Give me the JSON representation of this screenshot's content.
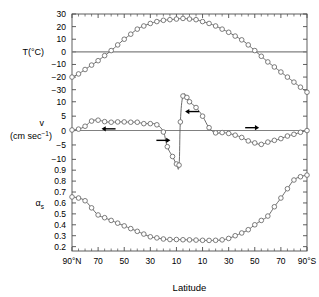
{
  "figure": {
    "background_color": "#ffffff",
    "frame_color": "#4d4d4d",
    "curve_color": "#5a5a5a",
    "marker_color": "#666666",
    "zero_line_color": "#808080",
    "arrow_color": "#000000"
  },
  "axes": {
    "x": {
      "title": "Latitude",
      "tick_labels": [
        "90°N",
        "70",
        "50",
        "30",
        "10",
        "10",
        "30",
        "50",
        "70",
        "90°S"
      ],
      "tick_values": [
        90,
        70,
        50,
        30,
        10,
        -10,
        -30,
        -50,
        -70,
        -90
      ],
      "range": [
        90,
        -90
      ],
      "minor_tick_step": 5
    },
    "temperature": {
      "label": "T(°C)",
      "unit": "°C",
      "tick_labels": [
        "30",
        "20",
        "10",
        "0",
        "−10",
        "−20",
        "−30"
      ],
      "tick_values": [
        30,
        20,
        10,
        0,
        -10,
        -20,
        -30
      ],
      "range": [
        -35,
        30
      ]
    },
    "velocity": {
      "label_line1": "v",
      "label_line2_prefix": "(cm sec",
      "label_line2_sup": "−1",
      "label_line2_suffix": ")",
      "tick_labels": [
        "10",
        "5",
        "0",
        "−5",
        "−10"
      ],
      "tick_values": [
        10,
        5,
        0,
        -5,
        -10
      ],
      "range": [
        -13,
        12
      ]
    },
    "albedo": {
      "label_base": "α",
      "label_sub": "s",
      "tick_labels": [
        "0.9",
        "0.8",
        "0.7",
        "0.6",
        "0.5",
        "0.4",
        "0.3",
        "0.2"
      ],
      "tick_values": [
        0.9,
        0.8,
        0.7,
        0.6,
        0.5,
        0.4,
        0.3,
        0.2
      ],
      "range": [
        0.16,
        0.92
      ]
    }
  },
  "chart_data": {
    "type": "line",
    "title": "",
    "subtitle": "",
    "xlabel": "Latitude",
    "ylabel": "",
    "grid": false,
    "legend": "none",
    "x": [
      90,
      85,
      80,
      75,
      70,
      65,
      60,
      55,
      50,
      45,
      40,
      35,
      30,
      25,
      20,
      15,
      10,
      5,
      0,
      -5,
      -10,
      -15,
      -20,
      -25,
      -30,
      -35,
      -40,
      -45,
      -50,
      -55,
      -60,
      -65,
      -70,
      -75,
      -80,
      -85,
      -90
    ],
    "panels": [
      {
        "name": "temperature",
        "ylabel": "T(°C)",
        "ylim": [
          -35,
          30
        ],
        "zero_line": 0,
        "marker": "circle",
        "points": [
          {
            "x": 90,
            "y": -20.0
          },
          {
            "x": 85,
            "y": -17.5
          },
          {
            "x": 80,
            "y": -14.0
          },
          {
            "x": 75,
            "y": -10.5
          },
          {
            "x": 70,
            "y": -7.0
          },
          {
            "x": 65,
            "y": -3.0
          },
          {
            "x": 60,
            "y": 1.0
          },
          {
            "x": 55,
            "y": 5.5
          },
          {
            "x": 50,
            "y": 10.0
          },
          {
            "x": 45,
            "y": 14.0
          },
          {
            "x": 40,
            "y": 18.0
          },
          {
            "x": 35,
            "y": 20.5
          },
          {
            "x": 30,
            "y": 22.5
          },
          {
            "x": 25,
            "y": 24.0
          },
          {
            "x": 20,
            "y": 25.0
          },
          {
            "x": 15,
            "y": 25.5
          },
          {
            "x": 10,
            "y": 26.0
          },
          {
            "x": 5,
            "y": 26.5
          },
          {
            "x": 0,
            "y": 26.0
          },
          {
            "x": -5,
            "y": 25.5
          },
          {
            "x": -10,
            "y": 24.0
          },
          {
            "x": -15,
            "y": 22.5
          },
          {
            "x": -20,
            "y": 20.5
          },
          {
            "x": -25,
            "y": 18.0
          },
          {
            "x": -30,
            "y": 15.5
          },
          {
            "x": -35,
            "y": 12.5
          },
          {
            "x": -40,
            "y": 9.5
          },
          {
            "x": -45,
            "y": 5.5
          },
          {
            "x": -50,
            "y": 1.0
          },
          {
            "x": -55,
            "y": -3.5
          },
          {
            "x": -60,
            "y": -8.0
          },
          {
            "x": -65,
            "y": -12.0
          },
          {
            "x": -70,
            "y": -16.0
          },
          {
            "x": -75,
            "y": -20.0
          },
          {
            "x": -80,
            "y": -24.0
          },
          {
            "x": -85,
            "y": -28.0
          },
          {
            "x": -90,
            "y": -32.0
          }
        ]
      },
      {
        "name": "velocity",
        "ylabel": "v (cm sec-1)",
        "ylim": [
          -13,
          12
        ],
        "zero_line": 0,
        "marker": "circle",
        "points": [
          {
            "x": 90,
            "y": 0.2
          },
          {
            "x": 85,
            "y": 0.5
          },
          {
            "x": 80,
            "y": 1.5
          },
          {
            "x": 75,
            "y": 3.3
          },
          {
            "x": 70,
            "y": 3.6
          },
          {
            "x": 65,
            "y": 3.1
          },
          {
            "x": 60,
            "y": 2.9
          },
          {
            "x": 55,
            "y": 3.0
          },
          {
            "x": 50,
            "y": 3.0
          },
          {
            "x": 45,
            "y": 2.9
          },
          {
            "x": 40,
            "y": 2.9
          },
          {
            "x": 35,
            "y": 2.4
          },
          {
            "x": 30,
            "y": 2.4
          },
          {
            "x": 25,
            "y": 2.0
          },
          {
            "x": 20,
            "y": -0.5
          },
          {
            "x": 17,
            "y": -5.6
          },
          {
            "x": 13,
            "y": -9.0
          },
          {
            "x": 10,
            "y": -11.6
          },
          {
            "x": 8,
            "y": -12.0
          },
          {
            "x": 7,
            "y": 3.0
          },
          {
            "x": 5,
            "y": 12.0
          },
          {
            "x": 2,
            "y": 11.5
          },
          {
            "x": 0,
            "y": 10.0
          },
          {
            "x": -5,
            "y": 8.0
          },
          {
            "x": -10,
            "y": 5.0
          },
          {
            "x": -15,
            "y": 1.0
          },
          {
            "x": -20,
            "y": -0.8
          },
          {
            "x": -25,
            "y": -0.7
          },
          {
            "x": -30,
            "y": -1.0
          },
          {
            "x": -35,
            "y": -1.6
          },
          {
            "x": -40,
            "y": -2.4
          },
          {
            "x": -45,
            "y": -3.6
          },
          {
            "x": -50,
            "y": -4.3
          },
          {
            "x": -55,
            "y": -4.8
          },
          {
            "x": -60,
            "y": -4.0
          },
          {
            "x": -65,
            "y": -3.4
          },
          {
            "x": -70,
            "y": -2.8
          },
          {
            "x": -75,
            "y": -1.9
          },
          {
            "x": -80,
            "y": -1.3
          },
          {
            "x": -85,
            "y": -0.6
          },
          {
            "x": -90,
            "y": 0.0
          }
        ],
        "annotations": [
          {
            "name": "arrow-northern-westerly",
            "x": 62,
            "y": 0.6,
            "direction": "left",
            "length": 14
          },
          {
            "name": "arrow-north-tropics",
            "x": 20,
            "y": -3.4,
            "direction": "right",
            "length": 14
          },
          {
            "name": "arrow-equatorial",
            "x": -2,
            "y": 6.6,
            "direction": "left",
            "length": 14
          },
          {
            "name": "arrow-southern",
            "x": -48,
            "y": 1.0,
            "direction": "right",
            "length": 14
          }
        ]
      },
      {
        "name": "albedo",
        "ylabel": "alpha_s",
        "ylim": [
          0.16,
          0.92
        ],
        "marker": "circle",
        "points": [
          {
            "x": 90,
            "y": 0.655
          },
          {
            "x": 85,
            "y": 0.645
          },
          {
            "x": 80,
            "y": 0.62
          },
          {
            "x": 75,
            "y": 0.555
          },
          {
            "x": 70,
            "y": 0.49
          },
          {
            "x": 65,
            "y": 0.465
          },
          {
            "x": 60,
            "y": 0.44
          },
          {
            "x": 55,
            "y": 0.415
          },
          {
            "x": 50,
            "y": 0.39
          },
          {
            "x": 45,
            "y": 0.365
          },
          {
            "x": 40,
            "y": 0.34
          },
          {
            "x": 35,
            "y": 0.315
          },
          {
            "x": 30,
            "y": 0.29
          },
          {
            "x": 25,
            "y": 0.28
          },
          {
            "x": 20,
            "y": 0.27
          },
          {
            "x": 15,
            "y": 0.265
          },
          {
            "x": 10,
            "y": 0.265
          },
          {
            "x": 5,
            "y": 0.263
          },
          {
            "x": 0,
            "y": 0.262
          },
          {
            "x": -5,
            "y": 0.26
          },
          {
            "x": -10,
            "y": 0.258
          },
          {
            "x": -15,
            "y": 0.257
          },
          {
            "x": -20,
            "y": 0.258
          },
          {
            "x": -25,
            "y": 0.262
          },
          {
            "x": -30,
            "y": 0.275
          },
          {
            "x": -35,
            "y": 0.3
          },
          {
            "x": -40,
            "y": 0.325
          },
          {
            "x": -45,
            "y": 0.355
          },
          {
            "x": -50,
            "y": 0.4
          },
          {
            "x": -55,
            "y": 0.44
          },
          {
            "x": -60,
            "y": 0.48
          },
          {
            "x": -65,
            "y": 0.565
          },
          {
            "x": -70,
            "y": 0.645
          },
          {
            "x": -75,
            "y": 0.73
          },
          {
            "x": -80,
            "y": 0.81
          },
          {
            "x": -85,
            "y": 0.84
          },
          {
            "x": -90,
            "y": 0.855
          }
        ]
      }
    ]
  }
}
